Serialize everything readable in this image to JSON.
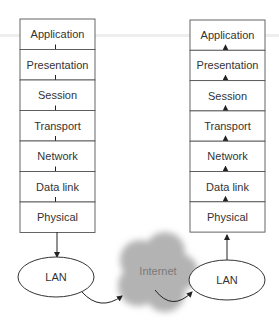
{
  "left_stack": {
    "layers": [
      "Application",
      "Presentation",
      "Session",
      "Transport",
      "Network",
      "Data link",
      "Physical"
    ],
    "direction": "down"
  },
  "right_stack": {
    "layers": [
      "Application",
      "Presentation",
      "Session",
      "Transport",
      "Network",
      "Data link",
      "Physical"
    ],
    "direction": "up"
  },
  "left_lan": {
    "label": "LAN"
  },
  "right_lan": {
    "label": "LAN"
  },
  "cloud": {
    "label": "Internet"
  },
  "colors": {
    "cloud": "#b3b3b3",
    "stroke": "#555555",
    "text": "#333333"
  }
}
